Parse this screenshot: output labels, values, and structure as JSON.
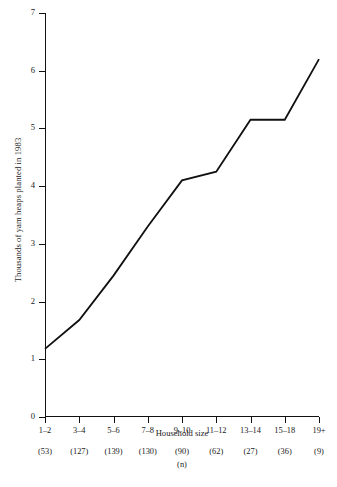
{
  "chart_data": {
    "type": "line",
    "title": "",
    "xlabel": "Household size",
    "ylabel": "Thousands of yam heaps planted in 1983",
    "categories": [
      "1–2",
      "3–4",
      "5–6",
      "7–8",
      "9–10",
      "11–12",
      "13–14",
      "15–18",
      "19+"
    ],
    "values": [
      1.18,
      1.68,
      2.45,
      3.3,
      4.1,
      4.25,
      5.15,
      5.15,
      6.2
    ],
    "n_label": "(n)",
    "n_values": [
      "(53)",
      "(127)",
      "(139)",
      "(130)",
      "(90)",
      "(62)",
      "(27)",
      "(36)",
      "(9)"
    ],
    "ylim": [
      0,
      7
    ],
    "yticks": [
      "0",
      "1",
      "2",
      "3",
      "4",
      "5",
      "6",
      "7"
    ],
    "grid": false,
    "legend": false,
    "line_color": "#111111"
  }
}
